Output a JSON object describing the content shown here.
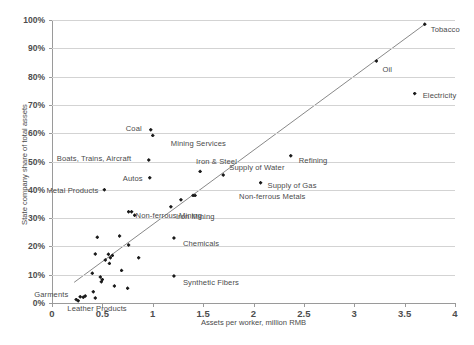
{
  "chart_data": {
    "type": "scatter",
    "title": "",
    "xlabel": "Assets per worker, million RMB",
    "ylabel": "State company share of total assets",
    "xlim": [
      0,
      4
    ],
    "ylim": [
      0,
      1
    ],
    "xticks": [
      "0",
      "0.5",
      "1",
      "1.5",
      "2",
      "2.5",
      "3",
      "3.5",
      "4"
    ],
    "xtick_values": [
      0,
      0.5,
      1,
      1.5,
      2,
      2.5,
      3,
      3.5,
      4
    ],
    "yticks": [
      "0%",
      "10%",
      "20%",
      "30%",
      "40%",
      "50%",
      "60%",
      "70%",
      "80%",
      "90%",
      "100%"
    ],
    "ytick_values": [
      0,
      0.1,
      0.2,
      0.3,
      0.4,
      0.5,
      0.6,
      0.7,
      0.8,
      0.9,
      1.0
    ],
    "grid": "horizontal",
    "legend": "none",
    "marker": "diamond",
    "marker_color": "#1a1a1a",
    "grid_color": "#d3d3d3",
    "trendline": {
      "present": true,
      "color": "#7a7a7a",
      "x_start": 0.22,
      "y_start": 0.073,
      "x_end": 3.7,
      "y_end": 0.985
    },
    "points": [
      {
        "label": "Tobacco",
        "x": 3.7,
        "y": 0.985,
        "label_dx": 6,
        "label_dy": 5
      },
      {
        "label": "Oil",
        "x": 3.22,
        "y": 0.855,
        "label_dx": 6,
        "label_dy": 8
      },
      {
        "label": "Electricity",
        "x": 3.6,
        "y": 0.74,
        "label_dx": 8,
        "label_dy": 1
      },
      {
        "label": "Refining",
        "x": 2.37,
        "y": 0.52,
        "label_dx": 8,
        "label_dy": 4
      },
      {
        "label": "Supply of Gas",
        "x": 2.07,
        "y": 0.425,
        "label_dx": 7,
        "label_dy": 2
      },
      {
        "label": "Supply of Water",
        "x": 1.7,
        "y": 0.452,
        "label_dx": 6,
        "label_dy": -8
      },
      {
        "label": "Non-ferrous Metals",
        "x": 1.42,
        "y": 0.38,
        "label_dx": 44,
        "label_dy": 1
      },
      {
        "label": "Iron & Steel",
        "x": 1.47,
        "y": 0.465,
        "label_dx": -4,
        "label_dy": -10
      },
      {
        "label": "Coal",
        "x": 0.98,
        "y": 0.612,
        "label_dx": -25,
        "label_dy": -2
      },
      {
        "label": "Mining Services",
        "x": 1.0,
        "y": 0.592,
        "label_dx": 18,
        "label_dy": 8
      },
      {
        "label": "Boats, Trains, Aircraft",
        "x": 0.96,
        "y": 0.505,
        "label_dx": -92,
        "label_dy": -2
      },
      {
        "label": "Autos",
        "x": 0.97,
        "y": 0.443,
        "label_dx": -27,
        "label_dy": 0
      },
      {
        "label": "Metal Products",
        "x": 0.52,
        "y": 0.4,
        "label_dx": -58,
        "label_dy": 0
      },
      {
        "label": "Non-ferrous Mining",
        "x": 0.79,
        "y": 0.322,
        "label_dx": 4,
        "label_dy": 3
      },
      {
        "label": "Iron Mining",
        "x": 1.18,
        "y": 0.34,
        "label_dx": 0,
        "label_dy": 9
      },
      {
        "label": "Chemicals",
        "x": 1.21,
        "y": 0.23,
        "label_dx": 9,
        "label_dy": 5
      },
      {
        "label": "Synthetic Fibers",
        "x": 1.21,
        "y": 0.095,
        "label_dx": 9,
        "label_dy": 6
      },
      {
        "label": "Garments",
        "x": 0.24,
        "y": 0.012,
        "label_dx": -42,
        "label_dy": -6
      },
      {
        "label": "Leather Products",
        "x": 0.43,
        "y": 0.018,
        "label_dx": -28,
        "label_dy": 10
      },
      {
        "label": "",
        "x": 1.28,
        "y": 0.365
      },
      {
        "label": "",
        "x": 1.4,
        "y": 0.38
      },
      {
        "label": "",
        "x": 0.82,
        "y": 0.31
      },
      {
        "label": "",
        "x": 0.76,
        "y": 0.322
      },
      {
        "label": "",
        "x": 0.45,
        "y": 0.232
      },
      {
        "label": "",
        "x": 0.67,
        "y": 0.237
      },
      {
        "label": "",
        "x": 0.76,
        "y": 0.205
      },
      {
        "label": "",
        "x": 0.43,
        "y": 0.173
      },
      {
        "label": "",
        "x": 0.56,
        "y": 0.172
      },
      {
        "label": "",
        "x": 0.58,
        "y": 0.16
      },
      {
        "label": "",
        "x": 0.6,
        "y": 0.168
      },
      {
        "label": "",
        "x": 0.53,
        "y": 0.152
      },
      {
        "label": "",
        "x": 0.57,
        "y": 0.14
      },
      {
        "label": "",
        "x": 0.86,
        "y": 0.16
      },
      {
        "label": "",
        "x": 0.69,
        "y": 0.115
      },
      {
        "label": "",
        "x": 0.4,
        "y": 0.105
      },
      {
        "label": "",
        "x": 0.48,
        "y": 0.092
      },
      {
        "label": "",
        "x": 0.5,
        "y": 0.083
      },
      {
        "label": "",
        "x": 0.49,
        "y": 0.075
      },
      {
        "label": "",
        "x": 0.62,
        "y": 0.06
      },
      {
        "label": "",
        "x": 0.41,
        "y": 0.04
      },
      {
        "label": "",
        "x": 0.75,
        "y": 0.052
      },
      {
        "label": "",
        "x": 0.28,
        "y": 0.022
      },
      {
        "label": "",
        "x": 0.31,
        "y": 0.02
      },
      {
        "label": "",
        "x": 0.33,
        "y": 0.025
      },
      {
        "label": "",
        "x": 0.26,
        "y": 0.008
      }
    ]
  }
}
